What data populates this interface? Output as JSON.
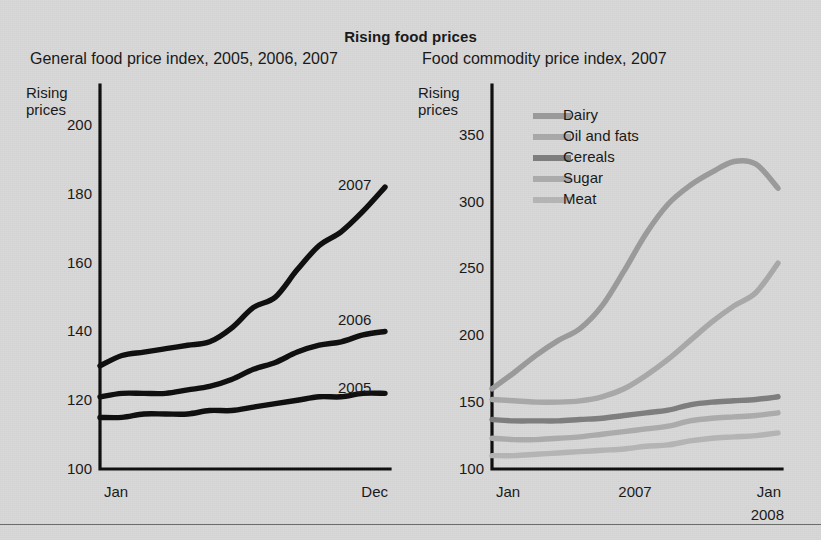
{
  "figure": {
    "main_title": "Rising food prices",
    "background_color": "#d9d9d9",
    "ink_color": "#101010"
  },
  "left_panel": {
    "title": "General food price index, 2005, 2006, 2007",
    "axis_caption_line1": "Rising",
    "axis_caption_line2": "prices",
    "tag_2007": "2007",
    "tag_2006": "2006",
    "tag_2005": "2005"
  },
  "right_panel": {
    "title": "Food commodity price index, 2007",
    "axis_caption_line1": "Rising",
    "axis_caption_line2": "prices",
    "legend": [
      {
        "label": "Dairy",
        "color": "#9a9a9a"
      },
      {
        "label": "Oil and fats",
        "color": "#a8a8a8"
      },
      {
        "label": "Cereals",
        "color": "#7e7e7e"
      },
      {
        "label": "Sugar",
        "color": "#ababab"
      },
      {
        "label": "Meat",
        "color": "#b4b4b4"
      }
    ]
  },
  "chart_data": [
    {
      "id": "general-food-price-index",
      "type": "line",
      "title": "General food price index, 2005, 2006, 2007",
      "xlabel": "",
      "ylabel": "Rising prices",
      "ylim": [
        100,
        205
      ],
      "yticks": [
        100,
        120,
        140,
        160,
        180,
        200
      ],
      "xticks": [
        "Jan",
        "Dec"
      ],
      "x": [
        "Jan",
        "Feb",
        "Mar",
        "Apr",
        "May",
        "Jun",
        "Jul",
        "Aug",
        "Sep",
        "Oct",
        "Nov",
        "Dec"
      ],
      "grid": false,
      "legend_position": "inline-labels-right",
      "series": [
        {
          "name": "2007",
          "color": "#101010",
          "values": [
            130,
            133,
            134,
            135,
            136,
            137,
            141,
            147,
            150,
            158,
            165,
            169,
            175,
            182
          ]
        },
        {
          "name": "2006",
          "color": "#101010",
          "values": [
            121,
            122,
            122,
            122,
            123,
            124,
            126,
            129,
            131,
            134,
            136,
            137,
            139,
            140
          ]
        },
        {
          "name": "2005",
          "color": "#101010",
          "values": [
            115,
            115,
            116,
            116,
            116,
            117,
            117,
            118,
            119,
            120,
            121,
            121,
            122,
            122
          ]
        }
      ]
    },
    {
      "id": "food-commodity-price-index",
      "type": "line",
      "title": "Food commodity price index, 2007",
      "xlabel": "",
      "ylabel": "Rising prices",
      "ylim": [
        100,
        370
      ],
      "yticks": [
        100,
        150,
        200,
        250,
        300,
        350
      ],
      "xticks": [
        "Jan",
        "2007",
        "Jan 2008"
      ],
      "x": [
        "Jan",
        "Feb",
        "Mar",
        "Apr",
        "May",
        "Jun",
        "Jul",
        "Aug",
        "Sep",
        "Oct",
        "Nov",
        "Dec",
        "Jan"
      ],
      "grid": false,
      "legend_position": "upper-left-inside",
      "series": [
        {
          "name": "Dairy",
          "color": "#9a9a9a",
          "values": [
            160,
            172,
            185,
            196,
            205,
            222,
            248,
            276,
            298,
            312,
            322,
            330,
            328,
            310
          ]
        },
        {
          "name": "Oil and fats",
          "color": "#a8a8a8",
          "values": [
            152,
            151,
            150,
            150,
            151,
            154,
            160,
            170,
            182,
            196,
            210,
            222,
            232,
            254
          ]
        },
        {
          "name": "Cereals",
          "color": "#7e7e7e",
          "values": [
            137,
            136,
            136,
            136,
            137,
            138,
            140,
            142,
            144,
            148,
            150,
            151,
            152,
            154
          ]
        },
        {
          "name": "Sugar",
          "color": "#ababab",
          "values": [
            123,
            122,
            122,
            123,
            124,
            126,
            128,
            130,
            132,
            136,
            138,
            139,
            140,
            142
          ]
        },
        {
          "name": "Meat",
          "color": "#b4b4b4",
          "values": [
            110,
            110,
            111,
            112,
            113,
            114,
            115,
            117,
            118,
            121,
            123,
            124,
            125,
            127
          ]
        }
      ]
    }
  ]
}
